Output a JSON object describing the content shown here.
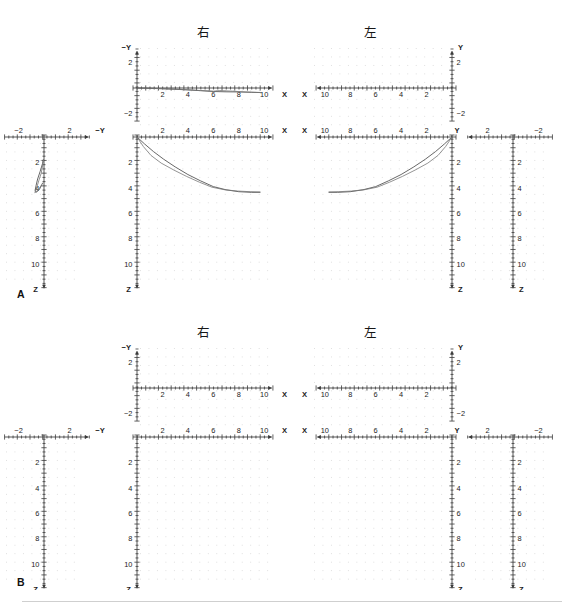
{
  "figure": {
    "width": 581,
    "height": 607,
    "background": "#ffffff",
    "axis_color": "#3a3a3a",
    "grid_dot_color": "#d8d8d8",
    "curve_colors": [
      "#4c4c4c",
      "#777777"
    ]
  },
  "panels": [
    {
      "id": "A",
      "label": "A",
      "has_data": true
    },
    {
      "id": "B",
      "label": "B",
      "has_data": false
    }
  ],
  "side_titles": {
    "right": "右",
    "left": "左"
  },
  "axis_names": {
    "x": "X",
    "y": "Y",
    "neg_y": "−Y",
    "z": "Z"
  },
  "ticks": {
    "x_major": [
      "2",
      "4",
      "6",
      "8",
      "10"
    ],
    "z_major": [
      "2",
      "4",
      "6",
      "8",
      "10"
    ],
    "y_major_positive": [
      "2"
    ],
    "y_major_negative": [
      "−2"
    ],
    "minor_per_major": 2
  },
  "views": [
    {
      "name": "right-xy",
      "side": "右",
      "xlabel": "X",
      "ylabel": "−Y",
      "xticks": [
        "2",
        "4",
        "6",
        "8",
        "10"
      ],
      "yticks": [
        "2",
        "−2"
      ],
      "x_direction": "right",
      "y_direction": "up"
    },
    {
      "name": "right-xz",
      "side": "右",
      "xlabel": "X",
      "ylabel": "Z",
      "xticks": [
        "2",
        "4",
        "6",
        "8",
        "10"
      ],
      "yticks": [
        "2",
        "4",
        "6",
        "8",
        "10"
      ],
      "x_direction": "right",
      "y_direction": "down"
    },
    {
      "name": "right-yz",
      "side": "右",
      "xlabel": "−Y",
      "ylabel": "Z",
      "xticks": [
        "−2",
        "2"
      ],
      "yticks": [
        "2",
        "4",
        "6",
        "8",
        "10"
      ],
      "x_direction": "right",
      "y_direction": "down"
    },
    {
      "name": "left-xy",
      "side": "左",
      "xlabel": "X",
      "ylabel": "Y",
      "xticks": [
        "10",
        "8",
        "6",
        "4",
        "2"
      ],
      "yticks": [
        "2",
        "−2"
      ],
      "x_direction": "left",
      "y_direction": "up"
    },
    {
      "name": "left-xz",
      "side": "左",
      "xlabel": "X",
      "ylabel": "Z",
      "xticks": [
        "10",
        "8",
        "6",
        "4",
        "2"
      ],
      "yticks": [
        "2",
        "4",
        "6",
        "8",
        "10"
      ],
      "x_direction": "left",
      "y_direction": "down"
    },
    {
      "name": "left-yz",
      "side": "左",
      "xlabel": "Y",
      "ylabel": "Z",
      "xticks": [
        "2",
        "−2"
      ],
      "yticks": [
        "2",
        "4",
        "6",
        "8",
        "10"
      ],
      "x_direction": "left",
      "y_direction": "down"
    }
  ],
  "chart_data": {
    "type": "line",
    "title": "",
    "subtitle": "",
    "grid": "dotted",
    "legend": "none",
    "units": "arbitrary",
    "panels": [
      {
        "panel": "A",
        "views": [
          {
            "view": "right-xy",
            "xlabel": "X",
            "ylabel": "−Y",
            "xlim": [
              0,
              11.5
            ],
            "ylim": [
              -2.2,
              2.2
            ],
            "series": [
              {
                "name": "trace-1",
                "color": "#4c4c4c",
                "x": [
                  0,
                  1,
                  2,
                  3,
                  4,
                  5,
                  6,
                  7,
                  8,
                  9,
                  9.8
                ],
                "y": [
                  0,
                  -0.05,
                  -0.12,
                  -0.2,
                  -0.3,
                  -0.42,
                  -0.55,
                  -0.6,
                  -0.62,
                  -0.68,
                  -0.72
                ]
              },
              {
                "name": "trace-2",
                "color": "#777777",
                "x": [
                  0,
                  1,
                  2,
                  3,
                  4,
                  5,
                  6,
                  6.5,
                  7.5,
                  8.5,
                  9.8
                ],
                "y": [
                  0,
                  -0.04,
                  -0.1,
                  -0.18,
                  -0.28,
                  -0.4,
                  -0.5,
                  -0.4,
                  -0.5,
                  -0.62,
                  -0.72
                ]
              }
            ]
          },
          {
            "view": "right-xz",
            "xlabel": "X",
            "ylabel": "Z",
            "xlim": [
              0,
              11.5
            ],
            "ylim": [
              0,
              12.5
            ],
            "note": "Z axis increases downward",
            "series": [
              {
                "name": "trace-1",
                "color": "#4c4c4c",
                "x": [
                  0,
                  0.6,
                  1.3,
                  2.1,
                  3.0,
                  4.0,
                  5.0,
                  6.0,
                  7.0,
                  8.0,
                  9.0,
                  9.7
                ],
                "z": [
                  0,
                  0.55,
                  1.15,
                  1.75,
                  2.35,
                  2.95,
                  3.45,
                  3.9,
                  4.15,
                  4.3,
                  4.35,
                  4.35
                ]
              },
              {
                "name": "trace-2",
                "color": "#777777",
                "x": [
                  0,
                  0.5,
                  1.1,
                  1.9,
                  2.9,
                  3.9,
                  4.9,
                  5.9,
                  6.9,
                  7.9,
                  8.9,
                  9.7
                ],
                "z": [
                  0,
                  0.75,
                  1.45,
                  2.05,
                  2.6,
                  3.1,
                  3.55,
                  3.95,
                  4.15,
                  4.25,
                  4.3,
                  4.32
                ]
              }
            ]
          },
          {
            "view": "right-yz",
            "xlabel": "−Y",
            "ylabel": "Z",
            "xlim": [
              -3.2,
              3.2
            ],
            "ylim": [
              0,
              12.5
            ],
            "series": [
              {
                "name": "trace-1",
                "color": "#4c4c4c",
                "y": [
                  -0.05,
                  -0.12,
                  -0.3,
                  -0.5,
                  -0.62,
                  -0.7,
                  -0.6,
                  -0.35,
                  -0.1
                ],
                "z": [
                  1.75,
                  2.1,
                  2.7,
                  3.3,
                  3.8,
                  4.2,
                  4.35,
                  4.1,
                  3.6
                ]
              },
              {
                "name": "trace-2",
                "color": "#777777",
                "y": [
                  -0.04,
                  -0.1,
                  -0.22,
                  -0.4,
                  -0.55,
                  -0.68,
                  -0.72,
                  -0.5,
                  -0.2
                ],
                "z": [
                  1.8,
                  2.2,
                  2.85,
                  3.4,
                  3.9,
                  4.25,
                  4.38,
                  4.2,
                  3.8
                ]
              }
            ]
          },
          {
            "view": "left-xy",
            "xlabel": "X",
            "ylabel": "Y",
            "xlim": [
              0,
              11.5
            ],
            "ylim": [
              -2.2,
              2.2
            ],
            "series": []
          },
          {
            "view": "left-xz",
            "xlabel": "X",
            "ylabel": "Z",
            "xlim": [
              0,
              11.5
            ],
            "ylim": [
              0,
              12.5
            ],
            "note": "mirror of right-xz; X increases to the left",
            "series": [
              {
                "name": "trace-1",
                "color": "#4c4c4c",
                "x": [
                  0,
                  0.6,
                  1.3,
                  2.1,
                  3.0,
                  4.0,
                  5.0,
                  6.0,
                  7.0,
                  8.0,
                  9.0,
                  9.7
                ],
                "z": [
                  0,
                  0.55,
                  1.15,
                  1.75,
                  2.35,
                  2.95,
                  3.45,
                  3.9,
                  4.15,
                  4.3,
                  4.35,
                  4.35
                ]
              },
              {
                "name": "trace-2",
                "color": "#777777",
                "x": [
                  0,
                  0.5,
                  1.1,
                  1.9,
                  2.9,
                  3.9,
                  4.9,
                  5.9,
                  6.9,
                  7.9,
                  8.9,
                  9.7
                ],
                "z": [
                  0,
                  0.75,
                  1.45,
                  2.05,
                  2.6,
                  3.1,
                  3.55,
                  3.95,
                  4.15,
                  4.25,
                  4.3,
                  4.32
                ]
              }
            ]
          },
          {
            "view": "left-yz",
            "xlabel": "Y",
            "ylabel": "Z",
            "xlim": [
              -3.2,
              3.2
            ],
            "ylim": [
              0,
              12.5
            ],
            "series": []
          }
        ]
      },
      {
        "panel": "B",
        "views": [
          {
            "view": "right-xy",
            "xlabel": "X",
            "ylabel": "−Y",
            "series": []
          },
          {
            "view": "right-xz",
            "xlabel": "X",
            "ylabel": "Z",
            "series": []
          },
          {
            "view": "right-yz",
            "xlabel": "−Y",
            "ylabel": "Z",
            "series": []
          },
          {
            "view": "left-xy",
            "xlabel": "X",
            "ylabel": "Y",
            "series": []
          },
          {
            "view": "left-xz",
            "xlabel": "X",
            "ylabel": "Z",
            "series": []
          },
          {
            "view": "left-yz",
            "xlabel": "Y",
            "ylabel": "Z",
            "series": []
          }
        ]
      }
    ]
  }
}
